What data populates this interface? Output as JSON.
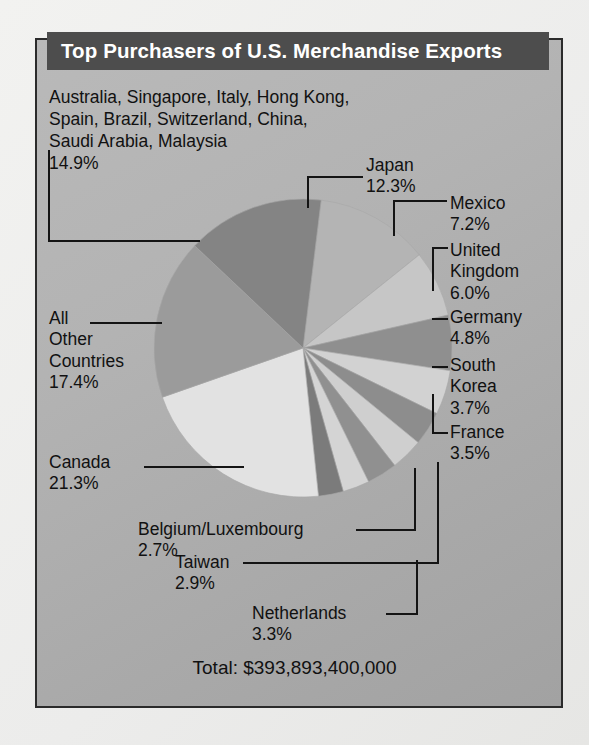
{
  "figure": {
    "title": "Top Purchasers of U.S. Merchandise Exports",
    "total_label": "Total: $393,893,400,000"
  },
  "labels": {
    "combined_countries": "Australia, Singapore, Italy, Hong Kong,\nSpain, Brazil, Switzerland, China,\nSaudi Arabia, Malaysia\n14.9%",
    "japan": "Japan\n12.3%",
    "mexico": "Mexico\n7.2%",
    "united_kingdom": "United\nKingdom\n6.0%",
    "germany": "Germany\n4.8%",
    "south_korea": "South\nKorea\n3.7%",
    "france": "France\n3.5%",
    "all_other_countries": "All\nOther\nCountries\n17.4%",
    "canada": "Canada\n21.3%",
    "belgium_luxembourg": "Belgium/Luxembourg\n2.7%",
    "taiwan": "Taiwan\n2.9%",
    "netherlands": "Netherlands\n3.3%"
  },
  "colors": {
    "banner_bg": "#4d4d4d",
    "banner_text": "#ffffff",
    "panel_bg": "#b0b0b0",
    "panel_border": "#2b2b2b",
    "page_bg": "#ededeb",
    "text": "#111111",
    "leader_line": "#141414"
  },
  "chart_data": {
    "type": "pie",
    "title": "Top Purchasers of U.S. Merchandise Exports",
    "total": "$393,893,400,000",
    "total_value": 393893400000,
    "unit": "percent of total merchandise exports",
    "legend": "labels with leader lines around pie",
    "start_angle_deg": -83,
    "direction": "clockwise",
    "labels": [
      "Japan",
      "Mexico",
      "United Kingdom",
      "Germany",
      "South Korea",
      "France",
      "Netherlands",
      "Taiwan",
      "Belgium/Luxembourg",
      "Canada",
      "All Other Countries",
      "Australia, Singapore, Italy, Hong Kong, Spain, Brazil, Switzerland, China, Saudi Arabia, Malaysia"
    ],
    "values": [
      12.3,
      7.2,
      6.0,
      4.8,
      3.7,
      3.5,
      3.3,
      2.9,
      2.7,
      21.3,
      17.4,
      14.9
    ],
    "slice_colors": [
      "#b4b4b4",
      "#c6c6c6",
      "#8f8f8f",
      "#d2d2d2",
      "#8d8d8d",
      "#cfcfcf",
      "#909090",
      "#d4d4d4",
      "#7b7b7b",
      "#e2e2e2",
      "#9b9b9b",
      "#848484"
    ]
  }
}
